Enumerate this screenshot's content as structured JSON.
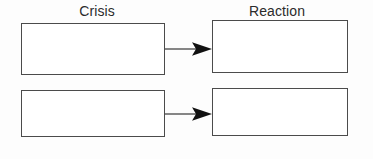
{
  "diagram": {
    "type": "two-column-flow",
    "background_color": "#fdfdfd",
    "border_color": "#4b4b4b",
    "text_color": "#2b2b2b",
    "arrow_color": "#111111",
    "columns": [
      {
        "id": "crisis",
        "header": "Crisis",
        "boxes": [
          {
            "id": "crisis-1",
            "text": ""
          },
          {
            "id": "crisis-2",
            "text": ""
          }
        ]
      },
      {
        "id": "reaction",
        "header": "Reaction",
        "boxes": [
          {
            "id": "reaction-1",
            "text": ""
          },
          {
            "id": "reaction-2",
            "text": ""
          }
        ]
      }
    ],
    "connectors": [
      {
        "id": "arrow-1",
        "from": "crisis-1",
        "to": "reaction-1",
        "style": "solid-line-filled-head"
      },
      {
        "id": "arrow-2",
        "from": "crisis-2",
        "to": "reaction-2",
        "style": "solid-line-filled-head"
      }
    ]
  }
}
